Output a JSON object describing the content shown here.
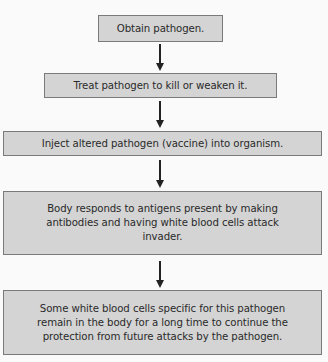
{
  "diagram": {
    "type": "flowchart",
    "direction": "top-to-bottom",
    "steps": [
      {
        "id": 1,
        "label": "Obtain pathogen."
      },
      {
        "id": 2,
        "label": "Treat pathogen to kill or weaken it."
      },
      {
        "id": 3,
        "label": "Inject altered pathogen (vaccine) into organism."
      },
      {
        "id": 4,
        "label": "Body responds to antigens present by making antibodies and  having white blood cells attack invader."
      },
      {
        "id": 5,
        "label": "Some white blood cells specific for this pathogen remain in the body for a long time to continue the protection from future attacks by the pathogen."
      }
    ],
    "connections": [
      {
        "from": 1,
        "to": 2
      },
      {
        "from": 2,
        "to": 3
      },
      {
        "from": 3,
        "to": 4
      },
      {
        "from": 4,
        "to": 5
      }
    ],
    "colors": {
      "box_fill": "#d4d4d4",
      "box_border": "#7a7a7a",
      "arrow": "#222222",
      "background": "#fafafa"
    }
  }
}
